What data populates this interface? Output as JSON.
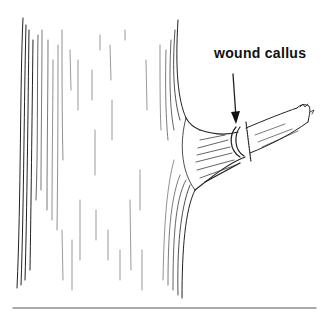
{
  "illustration": {
    "subject": "tree trunk with pruned branch",
    "label": "wound callus",
    "colors": {
      "ink": "#111111",
      "background": "#ffffff",
      "rule": "#555555"
    }
  }
}
